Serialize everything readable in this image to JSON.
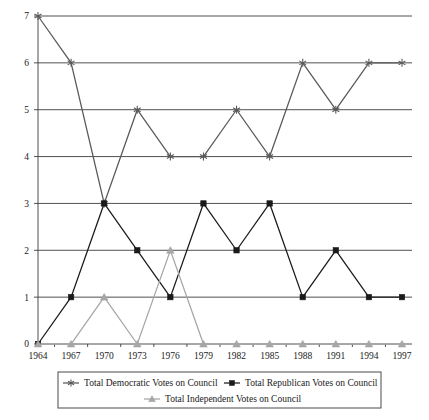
{
  "chart_data": {
    "type": "line",
    "title": "",
    "xlabel": "",
    "ylabel": "",
    "categories": [
      "1964",
      "1967",
      "1970",
      "1973",
      "1976",
      "1979",
      "1982",
      "1985",
      "1988",
      "1991",
      "1994",
      "1997"
    ],
    "ylim": [
      0,
      7
    ],
    "yticks": [
      "0",
      "1",
      "2",
      "3",
      "4",
      "5",
      "6",
      "7"
    ],
    "grid": true,
    "legend_position": "bottom",
    "series": [
      {
        "name": "Total Democratic Votes on Council",
        "marker": "asterisk",
        "color": "#595959",
        "values": [
          7,
          6,
          3,
          5,
          4,
          4,
          5,
          4,
          6,
          5,
          6,
          6
        ]
      },
      {
        "name": "Total Republican Votes on Council",
        "marker": "square",
        "color": "#1a1a1a",
        "values": [
          0,
          1,
          3,
          2,
          1,
          3,
          2,
          3,
          1,
          2,
          1,
          1
        ]
      },
      {
        "name": "Total Independent Votes on Council",
        "marker": "triangle",
        "color": "#a6a6a6",
        "values": [
          0,
          0,
          1,
          0,
          2,
          0,
          0,
          0,
          0,
          0,
          0,
          0
        ]
      }
    ]
  },
  "legend": {
    "items": [
      {
        "label": "Total Democratic Votes on Council"
      },
      {
        "label": "Total Republican Votes on Council"
      },
      {
        "label": "Total Independent Votes on Council"
      }
    ]
  },
  "colors": {
    "democratic": "#595959",
    "republican": "#1a1a1a",
    "independent": "#a6a6a6",
    "grid": "#3d3d3d",
    "text": "#1a1a1a",
    "background": "#ffffff"
  }
}
